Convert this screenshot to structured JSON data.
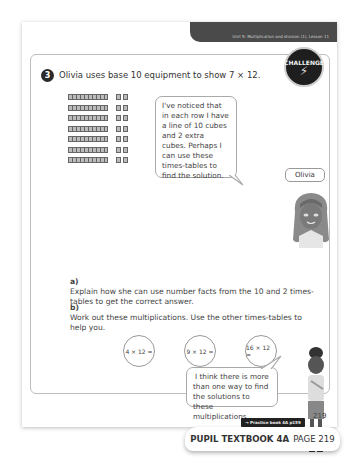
{
  "header": {
    "unit_lesson": "Unit 5: Multiplication and division (1), Lesson 11"
  },
  "badge": {
    "label": "CHALLENGE",
    "icon": "lightning-bolt-icon"
  },
  "question": {
    "number": "3",
    "text": "Olivia uses base 10 equipment to show 7 × 12.",
    "cube_rows": 7,
    "tens_per_row": 1,
    "ones_per_row": 2
  },
  "olivia_bubble": {
    "text": "I've noticed that in each row I have a line of 10 cubes and 2 extra cubes. Perhaps I can use these times-tables to find the solution."
  },
  "name_tag": "Olivia",
  "parts": [
    {
      "label": "a)",
      "text": "Explain how she can use number facts from the 10 and 2 times-tables to get the correct answer."
    },
    {
      "label": "b)",
      "text": "Work out these multiplications. Use the other times-tables to help you."
    }
  ],
  "multiplications": [
    "4 × 12 =",
    "9 × 12 =",
    "16 × 12 ="
  ],
  "second_bubble": {
    "text": "I think there is more than one way to find the solutions to these multiplications."
  },
  "footer": {
    "page_number": "219",
    "practice_ref": "→ Practice book 4A p159",
    "textbook_label": "PUPIL TEXTBOOK 4A",
    "page_label": "PAGE 219"
  }
}
